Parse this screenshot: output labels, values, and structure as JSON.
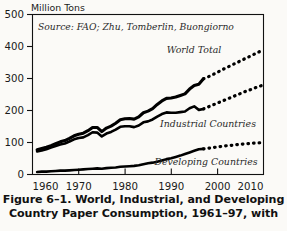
{
  "figure": {
    "caption_lines": [
      "Figure 6–1. World, Industrial, and Developing",
      "Country Paper Consumption, 1961–97, with"
    ]
  },
  "chart_data": {
    "type": "line",
    "title": "",
    "source_note": "Source: FAO; Zhu, Tomberlin, Buongiorno",
    "xlabel": "",
    "ylabel": "Million Tons",
    "xlim": [
      1960,
      2010
    ],
    "ylim": [
      0,
      500
    ],
    "xticks": [
      1960,
      1970,
      1980,
      1990,
      2000,
      2010
    ],
    "yticks": [
      0,
      100,
      200,
      300,
      400,
      500
    ],
    "grid": false,
    "legend": "inline-labels",
    "historical_range": [
      1961,
      1997
    ],
    "projected_range": [
      1997,
      2010
    ],
    "series": [
      {
        "name": "World Total",
        "label": "World Total",
        "style": "solid-then-dotted",
        "x": [
          1961,
          1962,
          1963,
          1964,
          1965,
          1966,
          1967,
          1968,
          1969,
          1970,
          1971,
          1972,
          1973,
          1974,
          1975,
          1976,
          1977,
          1978,
          1979,
          1980,
          1981,
          1982,
          1983,
          1984,
          1985,
          1986,
          1987,
          1988,
          1989,
          1990,
          1991,
          1992,
          1993,
          1994,
          1995,
          1996,
          1997
        ],
        "values": [
          77,
          81,
          85,
          90,
          96,
          102,
          106,
          113,
          121,
          126,
          129,
          137,
          147,
          147,
          134,
          145,
          151,
          160,
          171,
          174,
          175,
          173,
          180,
          193,
          198,
          206,
          219,
          230,
          238,
          239,
          242,
          247,
          252,
          267,
          278,
          282,
          299
        ],
        "projected_x": [
          1997,
          1998,
          1999,
          2000,
          2001,
          2002,
          2003,
          2004,
          2005,
          2006,
          2007,
          2008,
          2009,
          2010
        ],
        "projected_values": [
          299,
          305,
          312,
          319,
          327,
          334,
          341,
          348,
          355,
          362,
          369,
          376,
          383,
          390
        ]
      },
      {
        "name": "Industrial Countries",
        "label": "Industrial Countries",
        "style": "solid-then-dotted",
        "x": [
          1961,
          1962,
          1963,
          1964,
          1965,
          1966,
          1967,
          1968,
          1969,
          1970,
          1971,
          1972,
          1973,
          1974,
          1975,
          1976,
          1977,
          1978,
          1979,
          1980,
          1981,
          1982,
          1983,
          1984,
          1985,
          1986,
          1987,
          1988,
          1989,
          1990,
          1991,
          1992,
          1993,
          1994,
          1995,
          1996,
          1997
        ],
        "values": [
          72,
          75,
          79,
          84,
          89,
          94,
          97,
          103,
          110,
          114,
          116,
          123,
          132,
          131,
          119,
          128,
          133,
          140,
          149,
          151,
          151,
          148,
          153,
          163,
          166,
          172,
          181,
          189,
          194,
          193,
          193,
          195,
          197,
          207,
          213,
          202,
          205
        ],
        "projected_x": [
          1997,
          1998,
          1999,
          2000,
          2001,
          2002,
          2003,
          2004,
          2005,
          2006,
          2007,
          2008,
          2009,
          2010
        ],
        "projected_values": [
          205,
          211,
          217,
          223,
          229,
          235,
          241,
          247,
          253,
          259,
          264,
          270,
          275,
          280
        ]
      },
      {
        "name": "Developing Countries",
        "label": "Developing Countries",
        "style": "solid-then-dotted",
        "x": [
          1961,
          1962,
          1963,
          1964,
          1965,
          1966,
          1967,
          1968,
          1969,
          1970,
          1971,
          1972,
          1973,
          1974,
          1975,
          1976,
          1977,
          1978,
          1979,
          1980,
          1981,
          1982,
          1983,
          1984,
          1985,
          1986,
          1987,
          1988,
          1989,
          1990,
          1991,
          1992,
          1993,
          1994,
          1995,
          1996,
          1997
        ],
        "values": [
          8,
          9,
          9,
          10,
          11,
          12,
          12,
          13,
          14,
          15,
          16,
          17,
          18,
          19,
          18,
          20,
          21,
          22,
          24,
          25,
          26,
          27,
          29,
          32,
          35,
          37,
          40,
          44,
          48,
          51,
          55,
          59,
          64,
          69,
          74,
          79,
          80
        ],
        "projected_x": [
          1997,
          1998,
          1999,
          2000,
          2001,
          2002,
          2003,
          2004,
          2005,
          2006,
          2007,
          2008,
          2009,
          2010
        ],
        "projected_values": [
          80,
          82,
          84,
          86,
          88,
          90,
          91,
          93,
          94,
          96,
          97,
          98,
          99,
          100
        ]
      }
    ]
  },
  "labels": {
    "y_axis_title": "Million Tons",
    "world_total": "World Total",
    "industrial_countries": "Industrial Countries",
    "developing_countries": "Developing Countries",
    "source": "Source: FAO; Zhu, Tomberlin, Buongiorno",
    "y_0": "0",
    "y_100": "100",
    "y_200": "200",
    "y_300": "300",
    "y_400": "400",
    "y_500": "500",
    "x_1960": "1960",
    "x_1970": "1970",
    "x_1980": "1980",
    "x_1990": "1990",
    "x_2000": "2000",
    "x_2010": "2010"
  },
  "colors": {
    "ink": "#111111",
    "paper": "#fbfaf7"
  }
}
